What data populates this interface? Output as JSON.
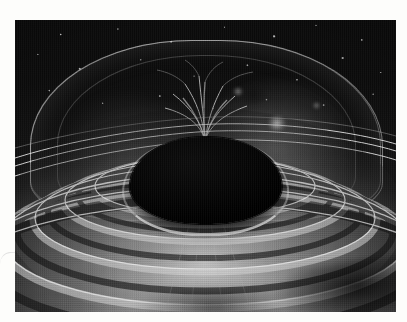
{
  "page": {
    "background_color": "#fdfdfb",
    "margin_note": "white paper margin surrounding a printed halftone photograph"
  },
  "figure": {
    "name": "astronomical-illustration",
    "medium": "grayscale halftone print",
    "palette": {
      "paper": "#fdfdfb",
      "deep_space": "#090909",
      "sphere_black": "#000000",
      "rim_highlight": "#ffffff",
      "disc_mid_gray": "#8e8e8e",
      "disc_light_gray": "#c8c8c8",
      "disc_dark_gray": "#1a1a1a"
    },
    "bounds": {
      "left": 15,
      "top": 20,
      "width": 381,
      "height": 292
    },
    "elements": {
      "central_body_label": "central black sphere",
      "dome_label": "magnetospheric dome",
      "plume_label": "filamentary polar plume",
      "disc_label": "concentric accretion disc rings",
      "rim_label": "bright inner rim highlight",
      "starfield_label": "background star field",
      "arcs_label": "thin bright sweeping arc lines"
    },
    "ring_count": 9,
    "arc_count": 3,
    "bright_knot_count": 4
  },
  "chart_data": {
    "type": "scatter",
    "title": "",
    "xlabel": "",
    "ylabel": "",
    "categories": [],
    "values": []
  }
}
